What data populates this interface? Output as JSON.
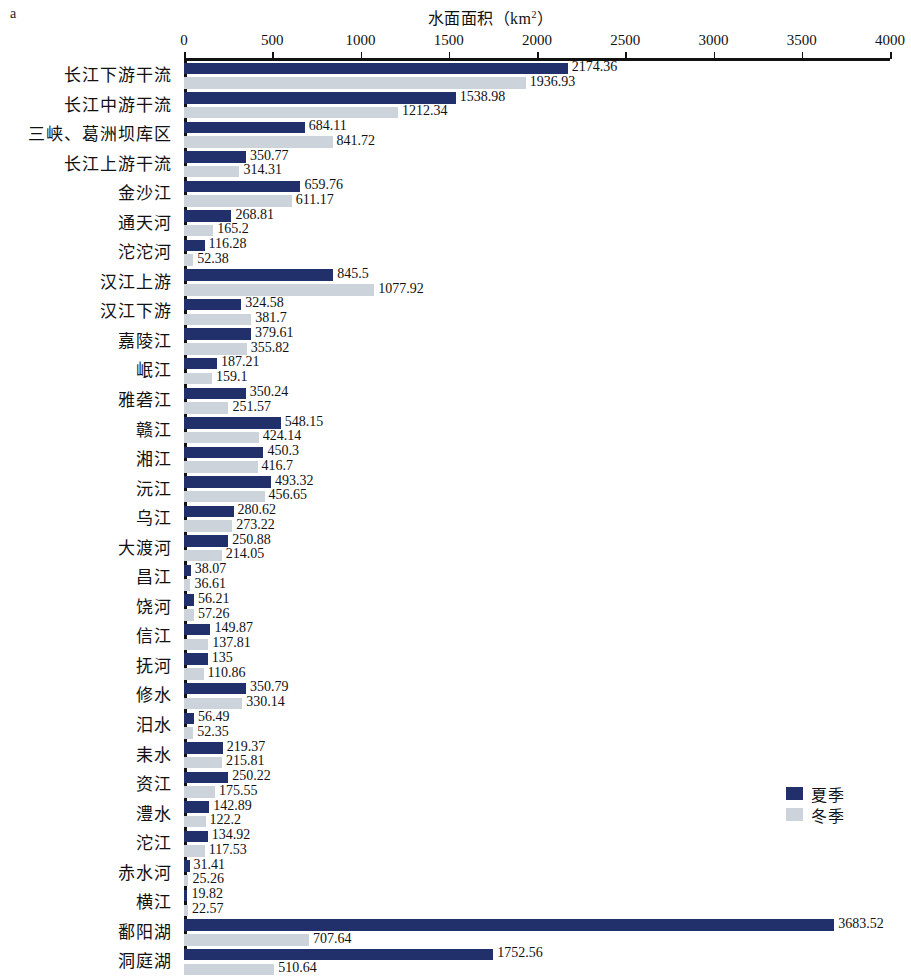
{
  "panel": {
    "letter": "a"
  },
  "legend": {
    "position": "bottom-right",
    "items": [
      {
        "label": "夏季",
        "color": "#21306b",
        "key": "summer"
      },
      {
        "label": "冬季",
        "color": "#ccd3da",
        "key": "winter"
      }
    ]
  },
  "axis": {
    "title": "水面面积（km",
    "title_sup": "2",
    "title_tail": "）",
    "ticks": [
      "0",
      "500",
      "1000",
      "1500",
      "2000",
      "2500",
      "3000",
      "3500",
      "4000"
    ]
  },
  "chart_data": {
    "type": "bar",
    "orientation": "horizontal",
    "title": "水面面积（km2）",
    "xlabel": "水面面积（km2）",
    "ylabel": "",
    "xlim": [
      0,
      4000
    ],
    "xticks": [
      0,
      500,
      1000,
      1500,
      2000,
      2500,
      3000,
      3500,
      4000
    ],
    "grid": false,
    "legend_position": "bottom-right",
    "categories": [
      "长江下游干流",
      "长江中游干流",
      "三峡、葛洲坝库区",
      "长江上游干流",
      "金沙江",
      "通天河",
      "沱沱河",
      "汉江上游",
      "汉江下游",
      "嘉陵江",
      "岷江",
      "雅砻江",
      "赣江",
      "湘江",
      "沅江",
      "乌江",
      "大渡河",
      "昌江",
      "饶河",
      "信江",
      "抚河",
      "修水",
      "汨水",
      "耒水",
      "资江",
      "澧水",
      "沱江",
      "赤水河",
      "横江",
      "鄱阳湖",
      "洞庭湖"
    ],
    "series": [
      {
        "name": "夏季",
        "color": "#21306b",
        "values": [
          2174.36,
          1538.98,
          684.11,
          350.77,
          659.76,
          268.81,
          116.28,
          845.5,
          324.58,
          379.61,
          187.21,
          350.24,
          548.15,
          450.3,
          493.32,
          280.62,
          250.88,
          38.07,
          56.21,
          149.87,
          135,
          350.79,
          56.49,
          219.37,
          250.22,
          142.89,
          134.92,
          31.41,
          19.82,
          3683.52,
          1752.56
        ],
        "labels": [
          "2174.36",
          "1538.98",
          "684.11",
          "350.77",
          "659.76",
          "268.81",
          "116.28",
          "845.5",
          "324.58",
          "379.61",
          "187.21",
          "350.24",
          "548.15",
          "450.3",
          "493.32",
          "280.62",
          "250.88",
          "38.07",
          "56.21",
          "149.87",
          "135",
          "350.79",
          "56.49",
          "219.37",
          "250.22",
          "142.89",
          "134.92",
          "31.41",
          "19.82",
          "3683.52",
          "1752.56"
        ]
      },
      {
        "name": "冬季",
        "color": "#ccd3da",
        "values": [
          1936.93,
          1212.34,
          841.72,
          314.31,
          611.17,
          165.2,
          52.38,
          1077.92,
          381.7,
          355.82,
          159.1,
          251.57,
          424.14,
          416.7,
          456.65,
          273.22,
          214.05,
          36.61,
          57.26,
          137.81,
          110.86,
          330.14,
          52.35,
          215.81,
          175.55,
          122.2,
          117.53,
          25.26,
          22.57,
          707.64,
          510.64
        ],
        "labels": [
          "1936.93",
          "1212.34",
          "841.72",
          "314.31",
          "611.17",
          "165.2",
          "52.38",
          "1077.92",
          "381.7",
          "355.82",
          "159.1",
          "251.57",
          "424.14",
          "416.7",
          "456.65",
          "273.22",
          "214.05",
          "36.61",
          "57.26",
          "137.81",
          "110.86",
          "330.14",
          "52.35",
          "215.81",
          "175.55",
          "122.2",
          "117.53",
          "25.26",
          "22.57",
          "707.64",
          "510.64"
        ]
      }
    ]
  }
}
